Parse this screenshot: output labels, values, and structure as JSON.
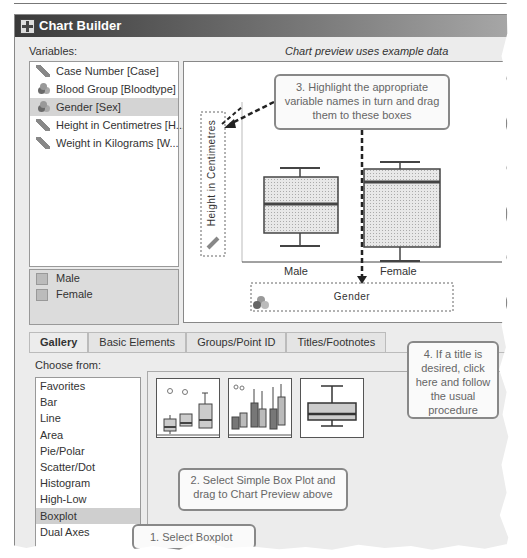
{
  "window": {
    "title": "Chart Builder"
  },
  "variables": {
    "label": "Variables:",
    "preview_note": "Chart preview uses example data",
    "items": [
      {
        "label": "Case Number [Case]",
        "icon": "scale-ruler-icon"
      },
      {
        "label": "Blood Group [Bloodtype]",
        "icon": "nominal-icon"
      },
      {
        "label": "Gender [Sex]",
        "icon": "nominal-icon",
        "selected": true
      },
      {
        "label": "Height in Centimetres [H...",
        "icon": "scale-ruler-icon"
      },
      {
        "label": "Weight in Kilograms [W...",
        "icon": "scale-ruler-icon"
      }
    ],
    "categories": [
      "Male",
      "Female"
    ]
  },
  "preview": {
    "y_drop_label": "Height in Centimetres",
    "x_drop_label": "Gender",
    "x_categories": [
      "Male",
      "Female"
    ]
  },
  "tabs": [
    {
      "label": "Gallery",
      "active": true
    },
    {
      "label": "Basic Elements"
    },
    {
      "label": "Groups/Point ID"
    },
    {
      "label": "Titles/Footnotes"
    }
  ],
  "gallery": {
    "choose_label": "Choose from:",
    "items": [
      "Favorites",
      "Bar",
      "Line",
      "Area",
      "Pie/Polar",
      "Scatter/Dot",
      "Histogram",
      "High-Low",
      "Boxplot",
      "Dual Axes"
    ],
    "selected": "Boxplot",
    "thumbnails": [
      "Simple Boxplot",
      "Clustered Boxplot",
      "1-D Boxplot"
    ]
  },
  "callouts": {
    "step1": "1. Select Boxplot",
    "step2": "2. Select Simple Box Plot and drag to Chart Preview above",
    "step3": "3. Highlight the appropriate variable names in turn and drag them to these boxes",
    "step4": "4. If a title is desired, click here and follow the usual procedure"
  }
}
